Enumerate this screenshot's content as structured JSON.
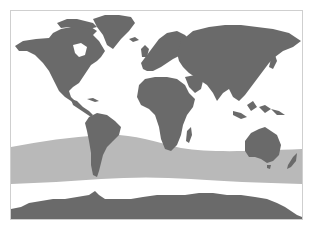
{
  "map": {
    "type": "world-distribution-map",
    "colors": {
      "background": "#ffffff",
      "frame": "#cfcfcf",
      "land": "#6a6a6a",
      "range_band": "#b9b9b9"
    },
    "regions": [
      {
        "name": "North America"
      },
      {
        "name": "Greenland"
      },
      {
        "name": "South America"
      },
      {
        "name": "Europe"
      },
      {
        "name": "Africa"
      },
      {
        "name": "Madagascar"
      },
      {
        "name": "Asia"
      },
      {
        "name": "Indonesia"
      },
      {
        "name": "Australia"
      },
      {
        "name": "New Zealand"
      },
      {
        "name": "Antarctica"
      }
    ],
    "range_band": {
      "description": "Southern Ocean circumpolar distribution band"
    }
  }
}
